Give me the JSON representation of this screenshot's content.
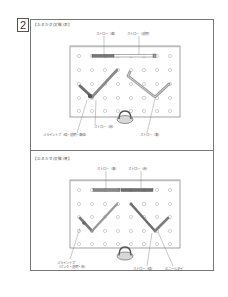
{
  "step": {
    "number": "2"
  },
  "panels": [
    {
      "title": "【おまかせ(実験)表】",
      "labels": {
        "straw_top_left": "ストロー（青）",
        "straw_top_right": "ストロー（透明）",
        "straw_bottom_mid": "ストロー（赤）",
        "joint_bottom_left": "ジョイントブ（緑・透明・青緑）",
        "straw_bottom_right": "ストロー（青）"
      }
    },
    {
      "title": "【おまかせ(実験)裏】",
      "labels": {
        "straw_top_left": "ストロー（青）",
        "straw_top_right": "ストロー（赤）",
        "joint_bottom_left_1": "ジョイントブ",
        "joint_bottom_left_2": "（ピンク・透明・赤）",
        "straw_bottom_mid": "ストロー（緑）",
        "wire_bottom_right": "ビニールタイ"
      }
    }
  ],
  "colors": {
    "border": "#777777",
    "board_edge": "#8a8a8a",
    "hole": "#b5b5b5",
    "straw_dark": "#6e6e6e",
    "straw_mid": "#9a9a9a",
    "straw_light": "#ffffff"
  }
}
